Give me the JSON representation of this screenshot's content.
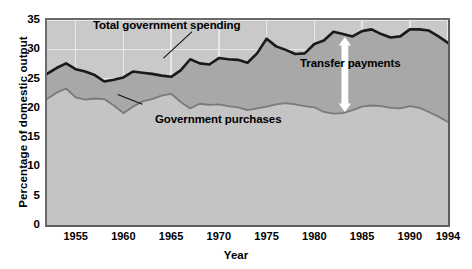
{
  "chart_data": {
    "type": "area",
    "title": "",
    "subtitle": "",
    "xlabel": "Year",
    "ylabel": "Percentage of domestic output",
    "xlim": [
      1952,
      1994
    ],
    "ylim": [
      0,
      35
    ],
    "ytick_values": [
      0,
      5,
      10,
      15,
      20,
      25,
      30,
      35
    ],
    "ytick_labels": [
      "0",
      "5",
      "10",
      "15",
      "20",
      "25",
      "30",
      "35"
    ],
    "xtick_values": [
      1955,
      1960,
      1965,
      1970,
      1975,
      1980,
      1985,
      1990,
      1994
    ],
    "xtick_labels": [
      "1955",
      "1960",
      "1965",
      "1970",
      "1975",
      "1980",
      "1985",
      "1990",
      "1994"
    ],
    "grid": "major gridlines, white, horizontal and vertical",
    "legend_position": "inline annotations on plot",
    "x": [
      1952,
      1953,
      1954,
      1955,
      1956,
      1957,
      1958,
      1959,
      1960,
      1961,
      1962,
      1963,
      1964,
      1965,
      1966,
      1967,
      1968,
      1969,
      1970,
      1971,
      1972,
      1973,
      1974,
      1975,
      1976,
      1977,
      1978,
      1979,
      1980,
      1981,
      1982,
      1983,
      1984,
      1985,
      1986,
      1987,
      1988,
      1989,
      1990,
      1991,
      1992,
      1993,
      1994
    ],
    "series": [
      {
        "name": "Total government spending",
        "color": "#1a1a1a",
        "fill": "#a8a8a8",
        "values": [
          25.8,
          26.8,
          27.6,
          26.6,
          26.2,
          25.6,
          24.5,
          24.8,
          25.2,
          26.2,
          26.0,
          25.8,
          25.5,
          25.3,
          26.4,
          28.3,
          27.6,
          27.4,
          28.5,
          28.3,
          28.2,
          27.7,
          29.3,
          31.8,
          30.5,
          29.9,
          29.2,
          29.3,
          30.9,
          31.5,
          33.0,
          32.6,
          32.2,
          33.1,
          33.4,
          32.6,
          32.0,
          32.2,
          33.4,
          33.4,
          33.2,
          32.2,
          31.1
        ]
      },
      {
        "name": "Government purchases",
        "color": "#7a7a7a",
        "fill": "#c4c4c4",
        "values": [
          21.5,
          22.6,
          23.3,
          21.8,
          21.4,
          21.6,
          21.5,
          20.4,
          19.1,
          20.2,
          21.1,
          21.5,
          22.1,
          22.4,
          21.0,
          19.9,
          20.7,
          20.5,
          20.6,
          20.3,
          20.1,
          19.6,
          19.9,
          20.2,
          20.6,
          20.8,
          20.6,
          20.3,
          20.1,
          19.3,
          19.0,
          19.1,
          19.6,
          20.2,
          20.4,
          20.3,
          20.0,
          19.9,
          20.3,
          20.0,
          19.3,
          18.5,
          17.6
        ]
      }
    ],
    "annotations": [
      {
        "text": "Total government spending",
        "kind": "series-label"
      },
      {
        "text": "Government purchases",
        "kind": "series-label"
      },
      {
        "text": "Transfer payments",
        "kind": "region-label"
      },
      {
        "text": "double-headed white arrow spanning the gap between the two curves near 1983",
        "kind": "arrow"
      }
    ]
  },
  "axes": {
    "ylabel": "Percentage of domestic output",
    "xlabel": "Year"
  },
  "annotations": {
    "total": "Total government spending",
    "purchases": "Government purchases",
    "transfer": "Transfer payments"
  },
  "colors": {
    "plot_background": "#c9c9c9",
    "gridline": "#e8e8e8",
    "total_line": "#1a1a1a",
    "purchases_line": "#7a7a7a",
    "transfer_band": "#a8a8a8",
    "purchases_band": "#c4c4c4",
    "arrow": "#ffffff",
    "frame": "#5d5d5d"
  }
}
